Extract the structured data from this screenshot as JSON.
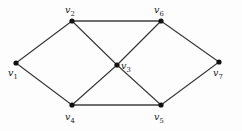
{
  "figure": {
    "kind": "undirected-graph-diagram",
    "background_color": "#fdfdfd",
    "width": 242,
    "height": 131
  },
  "graph": {
    "vertex_count": 7,
    "edge_count": 10,
    "vertices": [
      {
        "id": "v1",
        "name": "v",
        "index": "1",
        "x": 16,
        "y": 63,
        "label_x": 8,
        "label_y": 68
      },
      {
        "id": "v2",
        "name": "v",
        "index": "2",
        "x": 72,
        "y": 21,
        "label_x": 65,
        "label_y": 5
      },
      {
        "id": "v3",
        "name": "v",
        "index": "3",
        "x": 117,
        "y": 65,
        "label_x": 121,
        "label_y": 61
      },
      {
        "id": "v4",
        "name": "v",
        "index": "4",
        "x": 72,
        "y": 105,
        "label_x": 65,
        "label_y": 112
      },
      {
        "id": "v5",
        "name": "v",
        "index": "5",
        "x": 161,
        "y": 105,
        "label_x": 154,
        "label_y": 112
      },
      {
        "id": "v6",
        "name": "v",
        "index": "6",
        "x": 161,
        "y": 21,
        "label_x": 154,
        "label_y": 5
      },
      {
        "id": "v7",
        "name": "v",
        "index": "7",
        "x": 219,
        "y": 62,
        "label_x": 213,
        "label_y": 68
      }
    ],
    "edges": [
      {
        "id": "e-v1-v2",
        "from": "v1",
        "to": "v2",
        "style": "thin"
      },
      {
        "id": "e-v1-v4",
        "from": "v1",
        "to": "v4",
        "style": "thin"
      },
      {
        "id": "e-v2-v6",
        "from": "v2",
        "to": "v6",
        "style": "thick"
      },
      {
        "id": "e-v2-v3",
        "from": "v2",
        "to": "v3",
        "style": "thin"
      },
      {
        "id": "e-v6-v3",
        "from": "v6",
        "to": "v3",
        "style": "thin"
      },
      {
        "id": "e-v6-v7",
        "from": "v6",
        "to": "v7",
        "style": "thin"
      },
      {
        "id": "e-v3-v4",
        "from": "v3",
        "to": "v4",
        "style": "thin"
      },
      {
        "id": "e-v3-v5",
        "from": "v3",
        "to": "v5",
        "style": "thin"
      },
      {
        "id": "e-v4-v5",
        "from": "v4",
        "to": "v5",
        "style": "thick"
      },
      {
        "id": "e-v5-v7",
        "from": "v5",
        "to": "v7",
        "style": "thin"
      }
    ],
    "colors": {
      "edge": "#3a3a3a",
      "edge_highlight": "#6e6e6e",
      "vertex": "#111111",
      "label": "#1b1b1b"
    },
    "vertex_radius": 2.6
  }
}
